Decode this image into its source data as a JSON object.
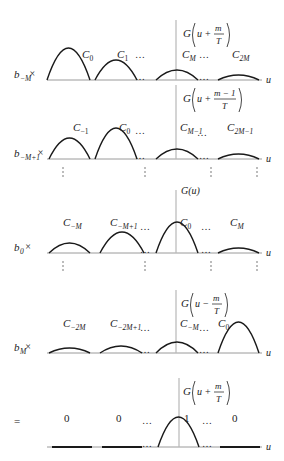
{
  "figure": {
    "width": 284,
    "height": 461,
    "colors": {
      "curve": "#1a1a1a",
      "axis": "#9a9a9a",
      "center_line": "#b8b8b8",
      "text": "#222222"
    },
    "axis_label": "u",
    "ellipsis": "…",
    "panels": [
      {
        "id": "panel-b-minus-M",
        "multiplier": {
          "base": "b",
          "sub": "−M",
          "suffix": "×"
        },
        "axis_y": 80,
        "center_x": 176,
        "center_top": 20,
        "function_label": {
          "prefix": "G",
          "arg": "u",
          "op": "+",
          "num": "m",
          "den": "T",
          "x": 183,
          "y": 22
        },
        "humps": [
          {
            "x0": 47,
            "x1": 90,
            "peak_y": 48,
            "label": {
              "base": "C",
              "sub": "0"
            },
            "lx": 82,
            "ly": 58
          },
          {
            "x0": 95,
            "x1": 137,
            "peak_y": 60,
            "label": {
              "base": "C",
              "sub": "1"
            },
            "lx": 117,
            "ly": 58
          },
          {
            "x0": 156,
            "x1": 198,
            "peak_y": 70,
            "label": {
              "base": "C",
              "sub": "M"
            },
            "lx": 182,
            "ly": 58
          },
          {
            "x0": 218,
            "x1": 259,
            "peak_y": 75,
            "label": {
              "base": "C",
              "sub": "2M"
            },
            "lx": 232,
            "ly": 58
          }
        ],
        "dots": [
          {
            "x": 141,
            "y": 58
          },
          {
            "x": 141,
            "y": 80
          },
          {
            "x": 205,
            "y": 58
          },
          {
            "x": 205,
            "y": 80
          }
        ],
        "vdots": []
      },
      {
        "id": "panel-b-minus-M-plus-1",
        "multiplier": {
          "base": "b",
          "sub": "−M+1",
          "suffix": "×"
        },
        "axis_y": 159,
        "center_x": 176,
        "center_top": 85,
        "function_label": {
          "prefix": "G",
          "arg": "u",
          "op": "+",
          "num": "m − 1",
          "den": "T",
          "x": 183,
          "y": 87
        },
        "humps": [
          {
            "x0": 49,
            "x1": 90,
            "peak_y": 138,
            "label": {
              "base": "C",
              "sub": "−1"
            },
            "lx": 73,
            "ly": 131
          },
          {
            "x0": 95,
            "x1": 137,
            "peak_y": 128,
            "label": {
              "base": "C",
              "sub": "0"
            },
            "lx": 119,
            "ly": 131
          },
          {
            "x0": 156,
            "x1": 198,
            "peak_y": 149,
            "label": {
              "base": "C",
              "sub": "M−1"
            },
            "lx": 180,
            "ly": 131
          },
          {
            "x0": 218,
            "x1": 259,
            "peak_y": 154,
            "label": {
              "base": "C",
              "sub": "2M−1"
            },
            "lx": 227,
            "ly": 131
          }
        ],
        "dots": [
          {
            "x": 141,
            "y": 134
          },
          {
            "x": 141,
            "y": 159
          },
          {
            "x": 203,
            "y": 136
          },
          {
            "x": 205,
            "y": 159
          }
        ],
        "vdots": [
          63,
          145,
          211,
          257
        ]
      },
      {
        "id": "panel-b-0",
        "multiplier": {
          "base": "b",
          "sub": "0",
          "suffix": "×"
        },
        "axis_y": 253,
        "center_x": 176,
        "center_top": 190,
        "function_label": {
          "simple": "G(u)",
          "x": 181,
          "y": 194
        },
        "humps": [
          {
            "x0": 49,
            "x1": 90,
            "peak_y": 243,
            "label": {
              "base": "C",
              "sub": "−M"
            },
            "lx": 63,
            "ly": 226
          },
          {
            "x0": 100,
            "x1": 144,
            "peak_y": 232,
            "label": {
              "base": "C",
              "sub": "−M+1"
            },
            "lx": 110,
            "ly": 226
          },
          {
            "x0": 156,
            "x1": 198,
            "peak_y": 222,
            "label": {
              "base": "C",
              "sub": "0"
            },
            "lx": 180,
            "ly": 226
          },
          {
            "x0": 218,
            "x1": 259,
            "peak_y": 248,
            "label": {
              "base": "C",
              "sub": "M"
            },
            "lx": 230,
            "ly": 226
          }
        ],
        "dots": [
          {
            "x": 146,
            "y": 230
          },
          {
            "x": 146,
            "y": 253
          },
          {
            "x": 207,
            "y": 230
          },
          {
            "x": 207,
            "y": 253
          }
        ],
        "vdots": [
          63,
          145,
          211,
          257
        ]
      },
      {
        "id": "panel-b-M",
        "multiplier": {
          "base": "b",
          "sub": "M",
          "suffix": "×"
        },
        "axis_y": 353,
        "center_x": 176,
        "center_top": 290,
        "function_label": {
          "prefix": "G",
          "arg": "u",
          "op": "−",
          "num": "m",
          "den": "T",
          "x": 181,
          "y": 292
        },
        "humps": [
          {
            "x0": 49,
            "x1": 90,
            "peak_y": 348,
            "label": {
              "base": "C",
              "sub": "−2M"
            },
            "lx": 63,
            "ly": 327
          },
          {
            "x0": 100,
            "x1": 142,
            "peak_y": 346,
            "label": {
              "base": "C",
              "sub": "−2M+1"
            },
            "lx": 110,
            "ly": 327
          },
          {
            "x0": 156,
            "x1": 198,
            "peak_y": 342,
            "label": {
              "base": "C",
              "sub": "−M"
            },
            "lx": 180,
            "ly": 327
          },
          {
            "x0": 218,
            "x1": 259,
            "peak_y": 322,
            "label": {
              "base": "C",
              "sub": "0"
            },
            "lx": 218,
            "ly": 327
          }
        ],
        "dots": [
          {
            "x": 146,
            "y": 331
          },
          {
            "x": 146,
            "y": 353
          },
          {
            "x": 205,
            "y": 331
          },
          {
            "x": 205,
            "y": 353
          }
        ],
        "vdots": []
      },
      {
        "id": "panel-sum",
        "multiplier": {
          "base": "=",
          "sub": "",
          "suffix": ""
        },
        "axis_y": 447,
        "center_x": 179,
        "center_top": 378,
        "function_label": {
          "prefix": "G",
          "arg": "u",
          "op": "+",
          "num": "m",
          "den": "T",
          "x": 183,
          "y": 380
        },
        "flats": [
          {
            "x0": 52,
            "x1": 92
          },
          {
            "x0": 102,
            "x1": 142
          },
          {
            "x0": 220,
            "x1": 260
          }
        ],
        "humps": [
          {
            "x0": 158,
            "x1": 199,
            "peak_y": 417,
            "label": {
              "base": "1",
              "sub": ""
            },
            "lx": 184,
            "ly": 422
          }
        ],
        "values": [
          {
            "text": "0",
            "x": 64,
            "y": 422
          },
          {
            "text": "0",
            "x": 116,
            "y": 422
          },
          {
            "text": "0",
            "x": 232,
            "y": 422
          }
        ],
        "dots": [
          {
            "x": 148,
            "y": 424
          },
          {
            "x": 148,
            "y": 447
          },
          {
            "x": 208,
            "y": 424
          },
          {
            "x": 208,
            "y": 447
          }
        ],
        "vdots": []
      }
    ]
  }
}
